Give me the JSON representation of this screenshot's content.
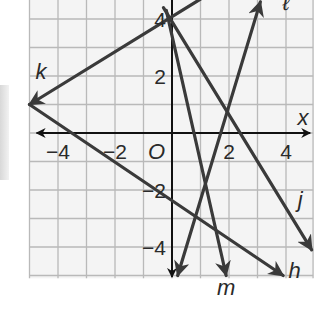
{
  "chart_data": {
    "type": "line",
    "title": "",
    "xlabel": "x",
    "ylabel": "",
    "origin_label": "O",
    "xlim": [
      -5,
      5
    ],
    "ylim": [
      -5,
      4.6
    ],
    "grid": true,
    "x_ticks": [
      {
        "value": -4,
        "label": "−4"
      },
      {
        "value": -2,
        "label": "−2"
      },
      {
        "value": 2,
        "label": "2"
      },
      {
        "value": 4,
        "label": "4"
      }
    ],
    "y_ticks": [
      {
        "value": 4,
        "label": "4"
      },
      {
        "value": 2,
        "label": "2"
      },
      {
        "value": -2,
        "label": "−2"
      },
      {
        "value": -4,
        "label": "−4"
      }
    ],
    "series": [
      {
        "name": "k",
        "points": [
          [
            1.0,
            4.7
          ],
          [
            -5,
            1
          ]
        ],
        "arrow_end": true,
        "label_pos": [
          -4.6,
          1.9
        ]
      },
      {
        "name": "h",
        "points": [
          [
            -5,
            1
          ],
          [
            3.9,
            -5
          ]
        ],
        "arrow_end": true,
        "label_pos": [
          4.3,
          -5.1
        ]
      },
      {
        "name": "ℓ",
        "points": [
          [
            0.2,
            -5
          ],
          [
            3.1,
            4.6
          ]
        ],
        "arrow_start": true,
        "arrow_end": true,
        "label_pos": [
          4.0,
          4.3
        ]
      },
      {
        "name": "m",
        "points": [
          [
            -0.2,
            4.3
          ],
          [
            1.9,
            -5
          ]
        ],
        "arrow_end": true,
        "label_pos": [
          1.9,
          -5.7
        ]
      },
      {
        "name": "j",
        "points": [
          [
            -0.3,
            4.4
          ],
          [
            4.9,
            -4.1
          ]
        ],
        "arrow_end": true,
        "label_pos": [
          4.5,
          -2.6
        ]
      }
    ]
  },
  "labels": {
    "x_axis": "x",
    "origin": "O"
  }
}
